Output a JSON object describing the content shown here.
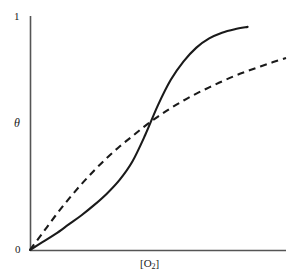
{
  "figure": {
    "background_color": "#ffffff",
    "line_color": "#1a1a1a",
    "axis_color": "#555555"
  },
  "axes": {
    "y_tick_top": "1",
    "y_tick_zero": "0",
    "y_axis_label": "θ",
    "x_axis_label_prefix": "[O",
    "x_axis_label_sub": "2",
    "x_axis_label_suffix": "]"
  },
  "chart_data": {
    "type": "line",
    "title": "",
    "subtitle": "",
    "xlabel": "[O2]",
    "ylabel": "θ",
    "xlim": [
      0,
      1
    ],
    "ylim": [
      0,
      1
    ],
    "grid": false,
    "legend": null,
    "x_tick_labels": [],
    "y_tick_labels": [
      "0",
      "1"
    ],
    "y_tick_values": [
      0,
      1
    ],
    "annotations": [],
    "series": [
      {
        "name": "sigmoidal-cooperative-binding",
        "style": "solid",
        "color": "#1a1a1a",
        "description": "Sigmoidal (S-shaped) cooperative oxygen binding curve; slow initial rise, steep mid-region, plateau near saturation 1",
        "x": [
          0.0,
          0.05,
          0.1,
          0.15,
          0.2,
          0.25,
          0.3,
          0.35,
          0.4,
          0.45,
          0.5,
          0.55,
          0.6,
          0.65,
          0.7,
          0.75,
          0.8,
          0.85
        ],
        "y": [
          0.0,
          0.035,
          0.07,
          0.11,
          0.15,
          0.195,
          0.245,
          0.305,
          0.385,
          0.5,
          0.63,
          0.74,
          0.82,
          0.88,
          0.92,
          0.945,
          0.96,
          0.97
        ]
      },
      {
        "name": "hyperbolic-noncooperative-binding",
        "style": "dashed",
        "color": "#1a1a1a",
        "description": "Hyperbolic (Michaelis-Menten-like) non-cooperative oxygen binding curve; steep initial rise then gradual approach to saturation",
        "x": [
          0.0,
          0.05,
          0.1,
          0.15,
          0.2,
          0.25,
          0.3,
          0.35,
          0.4,
          0.45,
          0.5,
          0.55,
          0.6,
          0.65,
          0.7,
          0.75,
          0.8,
          0.85,
          0.9,
          0.95,
          1.0
        ],
        "y": [
          0.0,
          0.075,
          0.15,
          0.22,
          0.285,
          0.345,
          0.4,
          0.45,
          0.495,
          0.54,
          0.58,
          0.617,
          0.65,
          0.68,
          0.707,
          0.733,
          0.757,
          0.778,
          0.798,
          0.817,
          0.835
        ]
      }
    ],
    "crossing_point": {
      "x": 0.46,
      "y": 0.59
    }
  }
}
